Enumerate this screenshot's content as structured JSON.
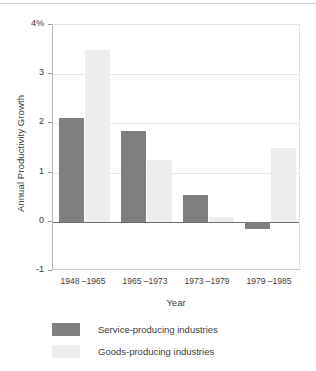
{
  "chart_data": {
    "type": "bar",
    "title": "",
    "xlabel": "Year",
    "ylabel": "Annual Productivity Growth",
    "categories": [
      "1948 –1965",
      "1965 –1973",
      "1973 –1979",
      "1979 –1985"
    ],
    "series": [
      {
        "name": "Service-producing industries",
        "color": "#7f7f7f",
        "values": [
          2.1,
          1.85,
          0.55,
          -0.15
        ]
      },
      {
        "name": "Goods-producing industries",
        "color": "#ededed",
        "values": [
          3.5,
          1.25,
          0.1,
          1.5
        ]
      }
    ],
    "ylim": [
      -1,
      4
    ],
    "yticks": [
      "-1",
      "0",
      "1",
      "2",
      "3",
      "4%"
    ],
    "ytick_values": [
      -1,
      0,
      1,
      2,
      3,
      4
    ],
    "grid": true,
    "gridlines_at": [
      1,
      2,
      3
    ],
    "zero_line": 0,
    "legend_position": "bottom-left",
    "legend": [
      "Service-producing industries",
      "Goods-producing industries"
    ]
  }
}
